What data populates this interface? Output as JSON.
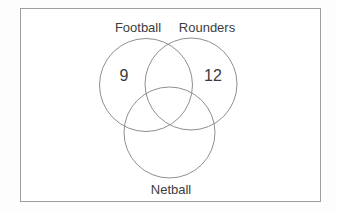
{
  "diagram": {
    "type": "venn",
    "sets": [
      {
        "label": "Football",
        "only_value": "9"
      },
      {
        "label": "Rounders",
        "only_value": "12"
      },
      {
        "label": "Netball",
        "only_value": ""
      }
    ],
    "overlap_values": {
      "football_rounders": "",
      "football_netball": "",
      "rounders_netball": "",
      "all_three": ""
    }
  },
  "colors": {
    "circle_stroke": "#8f8f8f",
    "frame_border": "#9e9e9e",
    "text": "#3d3d3d",
    "background": "#ffffff"
  }
}
